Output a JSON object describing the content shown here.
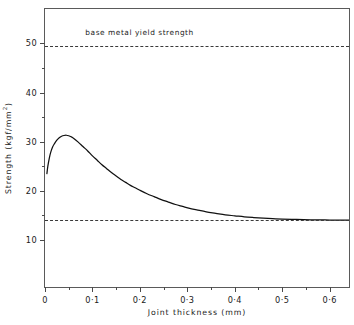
{
  "chart_data": {
    "type": "line",
    "title": "",
    "xlabel": "Joint  thickness   (mm)",
    "ylabel_text": "Strength  (kgf/mm",
    "ylabel_sup": "2",
    "ylabel_tail": ")",
    "xlim": [
      0,
      0.645
    ],
    "ylim": [
      0,
      57
    ],
    "grid": false,
    "legend": "none",
    "x_ticks": [
      0,
      0.1,
      0.2,
      0.3,
      0.4,
      0.5,
      0.6
    ],
    "x_tick_labels": [
      "0",
      "0·1",
      "0·2",
      "0·3",
      "0·4",
      "0·5",
      "0·6"
    ],
    "x_minor_ticks": [
      0.05,
      0.15,
      0.25,
      0.35,
      0.45,
      0.55
    ],
    "y_ticks": [
      10,
      20,
      30,
      40,
      50
    ],
    "y_tick_labels": [
      "10",
      "20",
      "30",
      "40",
      "50"
    ],
    "y_minor_ticks": [
      15,
      25,
      35,
      45
    ],
    "annotations": [
      {
        "name": "base-metal-yield-strength",
        "text": "base  metal  yield  strength",
        "x": 0.085,
        "y": 52.2
      }
    ],
    "reference_lines": [
      {
        "name": "base-metal-yield-strength-line",
        "y": 49.5,
        "style": "dashed",
        "color": "#3a3a3a"
      },
      {
        "name": "filler-metal-strength-line",
        "y": 14.0,
        "style": "dashed",
        "color": "#3a3a3a"
      }
    ],
    "series": [
      {
        "name": "joint-strength-curve",
        "color": "#111111",
        "x": [
          0.004,
          0.006,
          0.009,
          0.012,
          0.016,
          0.02,
          0.025,
          0.03,
          0.035,
          0.04,
          0.045,
          0.05,
          0.055,
          0.06,
          0.07,
          0.08,
          0.09,
          0.1,
          0.11,
          0.12,
          0.13,
          0.14,
          0.15,
          0.16,
          0.17,
          0.18,
          0.19,
          0.2,
          0.215,
          0.23,
          0.245,
          0.26,
          0.275,
          0.29,
          0.305,
          0.32,
          0.34,
          0.36,
          0.38,
          0.4,
          0.42,
          0.44,
          0.46,
          0.48,
          0.5,
          0.53,
          0.56,
          0.59,
          0.62,
          0.645
        ],
        "y": [
          23.5,
          25.0,
          26.6,
          27.8,
          28.9,
          29.6,
          30.3,
          30.8,
          31.1,
          31.25,
          31.3,
          31.2,
          31.0,
          30.7,
          29.9,
          29.0,
          28.1,
          27.1,
          26.2,
          25.3,
          24.5,
          23.7,
          23.0,
          22.3,
          21.7,
          21.1,
          20.6,
          20.1,
          19.4,
          18.8,
          18.2,
          17.7,
          17.2,
          16.8,
          16.4,
          16.1,
          15.7,
          15.4,
          15.1,
          14.9,
          14.7,
          14.55,
          14.42,
          14.32,
          14.24,
          14.15,
          14.09,
          14.05,
          14.02,
          14.0
        ]
      }
    ]
  },
  "figure": {
    "background_color": "#ffffff",
    "axis_color": "#5a5a5a",
    "text_color": "#1a1a1a"
  }
}
